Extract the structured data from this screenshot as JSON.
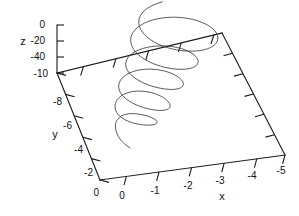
{
  "figure": {
    "background_color": "#ffffff",
    "line_color": "#1a1a1a",
    "curve_color": "#3c3c3c",
    "width": 299,
    "height": 216
  },
  "axes": {
    "x": {
      "name": "x",
      "ticks": [
        "0",
        "-1",
        "-2",
        "-3",
        "-4",
        "-5"
      ],
      "values": [
        0,
        -1,
        -2,
        -3,
        -4,
        -5
      ],
      "range": [
        0,
        -5.5
      ]
    },
    "y": {
      "name": "y",
      "ticks": [
        "0",
        "-2",
        "-4",
        "-6",
        "-8",
        "-10"
      ],
      "values": [
        0,
        -2,
        -4,
        -6,
        -8,
        -10
      ],
      "range": [
        0,
        -11
      ]
    },
    "z": {
      "name": "z",
      "ticks": [
        "0",
        "-20",
        "-40"
      ],
      "values": [
        0,
        -20,
        -40
      ],
      "range": [
        10,
        -60
      ]
    }
  },
  "chart_data": {
    "type": "line",
    "title": "",
    "xlabel": "x",
    "ylabel": "y",
    "zlabel": "z",
    "projection": "3d",
    "grid": false,
    "legend": null,
    "xlim": [
      0,
      -5.5
    ],
    "ylim": [
      0,
      -11
    ],
    "zlim": [
      10,
      -60
    ],
    "xticklabels": [
      "0",
      "-1",
      "-2",
      "-3",
      "-4",
      "-5"
    ],
    "yticklabels": [
      "0",
      "-2",
      "-4",
      "-6",
      "-8",
      "-10"
    ],
    "zticklabels": [
      "0",
      "-20",
      "-40"
    ],
    "series": [
      {
        "name": "trajectory",
        "color": "#3c3c3c",
        "points_screen": [
          [
            130.0,
            148.0
          ],
          [
            126.2,
            145.4
          ],
          [
            122.0,
            141.6
          ],
          [
            118.4,
            136.8
          ],
          [
            116.0,
            131.4
          ],
          [
            115.2,
            126.0
          ],
          [
            116.2,
            121.2
          ],
          [
            119.0,
            117.4
          ],
          [
            123.4,
            114.8
          ],
          [
            129.0,
            113.6
          ],
          [
            135.4,
            113.6
          ],
          [
            142.0,
            114.6
          ],
          [
            148.2,
            116.2
          ],
          [
            153.2,
            118.2
          ],
          [
            156.4,
            120.4
          ],
          [
            157.4,
            122.4
          ],
          [
            156.0,
            124.0
          ],
          [
            152.4,
            125.0
          ],
          [
            147.0,
            125.2
          ],
          [
            140.4,
            124.6
          ],
          [
            133.6,
            123.2
          ],
          [
            127.2,
            121.0
          ],
          [
            121.8,
            118.0
          ],
          [
            117.8,
            114.4
          ],
          [
            115.4,
            110.2
          ],
          [
            114.8,
            105.8
          ],
          [
            116.0,
            101.4
          ],
          [
            119.0,
            97.4
          ],
          [
            123.6,
            94.2
          ],
          [
            129.6,
            92.0
          ],
          [
            136.6,
            91.0
          ],
          [
            144.2,
            91.2
          ],
          [
            151.8,
            92.6
          ],
          [
            158.8,
            95.0
          ],
          [
            164.6,
            98.2
          ],
          [
            168.6,
            101.8
          ],
          [
            170.4,
            105.2
          ],
          [
            169.8,
            108.0
          ],
          [
            166.8,
            109.8
          ],
          [
            161.8,
            110.6
          ],
          [
            155.2,
            110.2
          ],
          [
            147.6,
            108.8
          ],
          [
            139.8,
            106.4
          ],
          [
            132.4,
            103.2
          ],
          [
            126.2,
            99.2
          ],
          [
            121.6,
            94.8
          ],
          [
            119.0,
            90.0
          ],
          [
            118.4,
            85.2
          ],
          [
            120.0,
            80.6
          ],
          [
            123.6,
            76.4
          ],
          [
            129.0,
            73.0
          ],
          [
            135.8,
            70.6
          ],
          [
            143.6,
            69.2
          ],
          [
            152.0,
            69.0
          ],
          [
            160.4,
            70.0
          ],
          [
            168.2,
            72.0
          ],
          [
            175.0,
            74.8
          ],
          [
            180.0,
            78.2
          ],
          [
            183.0,
            81.6
          ],
          [
            183.6,
            84.8
          ],
          [
            181.8,
            87.4
          ],
          [
            177.8,
            89.0
          ],
          [
            171.8,
            89.6
          ],
          [
            164.4,
            89.0
          ],
          [
            156.0,
            87.4
          ],
          [
            147.6,
            84.8
          ],
          [
            139.8,
            81.2
          ],
          [
            133.2,
            77.0
          ],
          [
            128.4,
            72.2
          ],
          [
            125.8,
            67.2
          ],
          [
            125.6,
            62.2
          ],
          [
            127.8,
            57.4
          ],
          [
            132.2,
            53.2
          ],
          [
            138.6,
            49.8
          ],
          [
            146.4,
            47.4
          ],
          [
            155.2,
            46.0
          ],
          [
            164.4,
            45.8
          ],
          [
            173.4,
            46.6
          ],
          [
            181.8,
            48.6
          ],
          [
            189.0,
            51.4
          ],
          [
            194.4,
            54.8
          ],
          [
            197.6,
            58.6
          ],
          [
            198.4,
            62.2
          ],
          [
            196.8,
            65.4
          ],
          [
            192.8,
            67.8
          ],
          [
            186.8,
            69.2
          ],
          [
            179.2,
            69.4
          ],
          [
            170.6,
            68.6
          ],
          [
            161.6,
            66.6
          ],
          [
            152.8,
            63.6
          ],
          [
            144.8,
            59.6
          ],
          [
            138.2,
            54.8
          ],
          [
            133.4,
            49.4
          ],
          [
            130.8,
            43.6
          ],
          [
            130.6,
            37.8
          ],
          [
            132.8,
            32.2
          ],
          [
            137.4,
            27.2
          ],
          [
            144.2,
            23.0
          ],
          [
            152.6,
            19.8
          ],
          [
            162.4,
            17.8
          ],
          [
            172.8,
            17.0
          ],
          [
            183.4,
            17.6
          ],
          [
            193.4,
            19.4
          ],
          [
            202.4,
            22.4
          ],
          [
            209.8,
            26.2
          ],
          [
            215.0,
            30.6
          ],
          [
            217.8,
            35.4
          ],
          [
            218.0,
            40.0
          ],
          [
            215.6,
            44.2
          ],
          [
            210.8,
            47.6
          ],
          [
            204.0,
            50.0
          ],
          [
            195.6,
            51.2
          ],
          [
            186.2,
            51.2
          ],
          [
            176.4,
            50.0
          ],
          [
            166.8,
            47.6
          ],
          [
            158.0,
            44.2
          ],
          [
            150.4,
            39.8
          ],
          [
            144.4,
            34.8
          ],
          [
            140.4,
            29.4
          ],
          [
            138.6,
            23.8
          ],
          [
            139.0,
            18.2
          ],
          [
            141.8,
            13.0
          ],
          [
            146.8,
            8.4
          ],
          [
            153.8,
            4.6
          ],
          [
            162.4,
            1.8
          ]
        ]
      }
    ]
  },
  "geometry": {
    "origin": [
      100,
      180
    ],
    "left_corner": [
      57,
      73
    ],
    "back_corner": [
      222,
      33
    ],
    "right_corner": [
      285,
      155
    ],
    "z_top": [
      57,
      25
    ]
  },
  "tick_labels": {
    "z": [
      {
        "text": "0",
        "x": 45,
        "y": 28
      },
      {
        "text": "-20",
        "x": 45,
        "y": 44
      },
      {
        "text": "-40",
        "x": 45,
        "y": 60
      }
    ],
    "z_axis_name": {
      "text": "z",
      "x": 23,
      "y": 44
    },
    "y": [
      {
        "text": "-10",
        "x": 48,
        "y": 77
      },
      {
        "text": "-8",
        "x": 62,
        "y": 105
      },
      {
        "text": "-6",
        "x": 72,
        "y": 130
      },
      {
        "text": "-4",
        "x": 83,
        "y": 155
      },
      {
        "text": "-2",
        "x": 93,
        "y": 178
      },
      {
        "text": "0",
        "x": 98,
        "y": 196
      }
    ],
    "y_axis_name": {
      "text": "y",
      "x": 55,
      "y": 137
    },
    "x": [
      {
        "text": "0",
        "x": 121,
        "y": 198
      },
      {
        "text": "-1",
        "x": 154,
        "y": 193
      },
      {
        "text": "-2",
        "x": 187,
        "y": 187
      },
      {
        "text": "-3",
        "x": 218,
        "y": 182
      },
      {
        "text": "-4",
        "x": 248,
        "y": 176
      },
      {
        "text": "-5",
        "x": 277,
        "y": 171
      }
    ],
    "x_axis_name": {
      "text": "x",
      "x": 222,
      "y": 198
    }
  }
}
